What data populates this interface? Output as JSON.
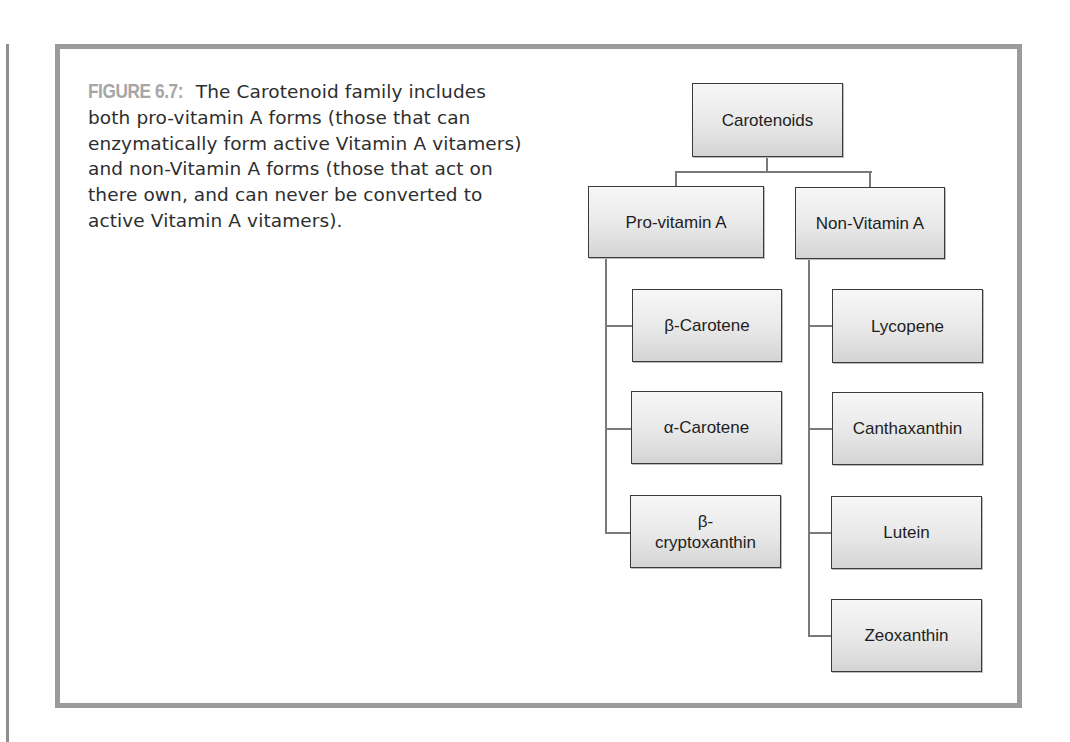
{
  "figure": {
    "label": "FIGURE 6.7:",
    "caption": " The Carotenoid family includes both pro-vitamin A forms (those that can enzymatically form active Vitamin A vitamers) and non-Vitamin A forms (those that act on there own, and can never be converted to active Vitamin A vitamers)."
  },
  "diagram": {
    "root": "Carotenoids",
    "branches": [
      {
        "label": "Pro-vitamin A",
        "children": [
          "β-Carotene",
          "α-Carotene",
          "β-\ncryptoxanthin"
        ]
      },
      {
        "label": "Non-Vitamin A",
        "children": [
          "Lycopene",
          "Canthaxanthin",
          "Lutein",
          "Zeoxanthin"
        ]
      }
    ]
  },
  "colors": {
    "frame": "#9b9b9b",
    "label": "#a6a6a6",
    "node_border": "#3a3a3a",
    "connector": "#7a7a7a"
  }
}
